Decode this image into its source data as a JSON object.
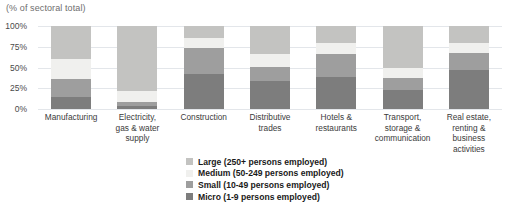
{
  "chart_data": {
    "type": "bar",
    "subtype": "stacked-bar-100-percent",
    "title": "",
    "axis_note": "(% of sectoral total)",
    "xlabel": "",
    "ylabel": "",
    "ylim": [
      0,
      100
    ],
    "yticks": [
      0,
      25,
      50,
      75,
      100
    ],
    "ytick_labels": [
      "0%",
      "25%",
      "50%",
      "75%",
      "100%"
    ],
    "grid": true,
    "legend_position": "bottom-center",
    "categories": [
      "Manufacturing",
      "Electricity, gas & water supply",
      "Construction",
      "Distributive trades",
      "Hotels & restaurants",
      "Transport, storage & communication",
      "Real estate, renting & business activities"
    ],
    "category_label_lines": [
      [
        "Manufacturing"
      ],
      [
        "Electricity,",
        "gas & water",
        "supply"
      ],
      [
        "Construction"
      ],
      [
        "Distributive",
        "trades"
      ],
      [
        "Hotels &",
        "restaurants"
      ],
      [
        "Transport,",
        "storage &",
        "communication"
      ],
      [
        "Real estate,",
        "renting &",
        "business",
        "activities"
      ]
    ],
    "series": [
      {
        "name": "Micro (1-9 persons employed)",
        "key": "micro",
        "color": "#7d7d7d",
        "values": [
          14,
          4,
          42,
          34,
          38,
          23,
          47
        ]
      },
      {
        "name": "Small (10-49 persons employed)",
        "key": "small",
        "color": "#9e9e9e",
        "values": [
          22,
          4,
          32,
          17,
          28,
          14,
          21
        ]
      },
      {
        "name": "Medium (50-249 persons employed)",
        "key": "medium",
        "color": "#f0f0ee",
        "values": [
          24,
          14,
          12,
          15,
          14,
          13,
          11
        ]
      },
      {
        "name": "Large (250+ persons employed)",
        "key": "large",
        "color": "#c3c3c1",
        "values": [
          40,
          78,
          14,
          34,
          20,
          50,
          21
        ]
      }
    ]
  },
  "legend": {
    "items": [
      {
        "label": "Large (250+ persons employed)",
        "color": "#c3c3c1"
      },
      {
        "label": "Medium (50-249 persons employed)",
        "color": "#f0f0ee"
      },
      {
        "label": "Small (10-49 persons employed)",
        "color": "#9e9e9e"
      },
      {
        "label": "Micro (1-9 persons employed)",
        "color": "#7d7d7d"
      }
    ]
  },
  "colors": {
    "gridline": "#e3e6ea",
    "axis_text": "#4a4a4a",
    "note_text": "#6e6e6e",
    "background": "#ffffff"
  }
}
